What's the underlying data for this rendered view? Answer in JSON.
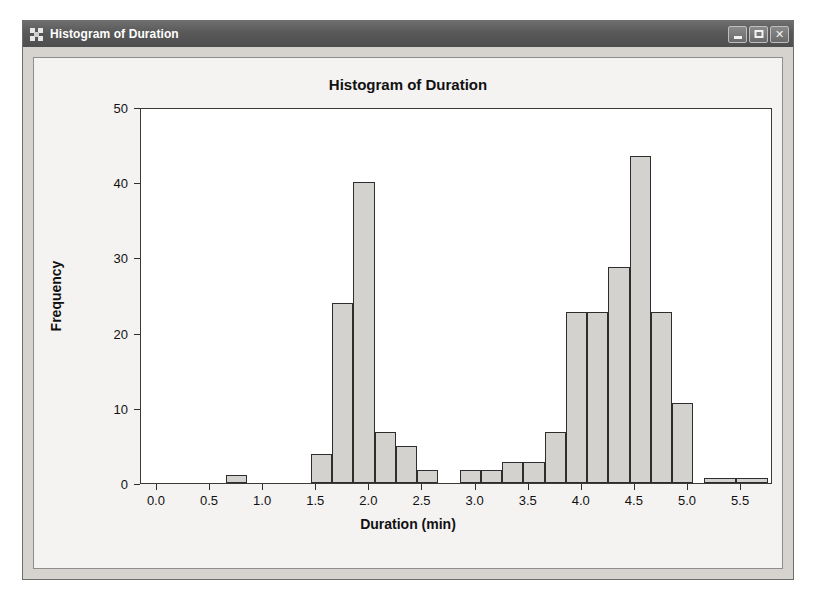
{
  "window": {
    "title": "Histogram of Duration",
    "icon": "app-grid-icon",
    "buttons": [
      {
        "name": "minimize",
        "label": "–"
      },
      {
        "name": "maximize",
        "label": "□"
      },
      {
        "name": "close",
        "label": "✕"
      }
    ]
  },
  "colors": {
    "titlebar": "#585858",
    "window_face": "#d6d3ce",
    "client_face": "#f4f3f1",
    "plot_face": "#ffffff",
    "bar_fill": "#d4d2cf",
    "bar_stroke": "#2e2e2e",
    "text": "#111111"
  },
  "chart_data": {
    "type": "bar",
    "title": "Histogram of Duration",
    "xlabel": "Duration (min)",
    "ylabel": "Frequency",
    "xlim": [
      -0.15,
      5.8
    ],
    "ylim": [
      0,
      50
    ],
    "xticks": [
      "0.0",
      "0.5",
      "1.0",
      "1.5",
      "2.0",
      "2.5",
      "3.0",
      "3.5",
      "4.0",
      "4.5",
      "5.0",
      "5.5"
    ],
    "xtick_values": [
      0.0,
      0.5,
      1.0,
      1.5,
      2.0,
      2.5,
      3.0,
      3.5,
      4.0,
      4.5,
      5.0,
      5.5
    ],
    "yticks": [
      "0",
      "10",
      "20",
      "30",
      "40",
      "50"
    ],
    "ytick_values": [
      0,
      10,
      20,
      30,
      40,
      50
    ],
    "grid": false,
    "legend": null,
    "bin_width": 0.2,
    "bins": [
      {
        "x0": 0.65,
        "x1": 0.85,
        "value": 1.0
      },
      {
        "x0": 1.45,
        "x1": 1.65,
        "value": 3.8
      },
      {
        "x0": 1.65,
        "x1": 1.85,
        "value": 24.0
      },
      {
        "x0": 1.85,
        "x1": 2.05,
        "value": 40.0
      },
      {
        "x0": 2.05,
        "x1": 2.25,
        "value": 6.8
      },
      {
        "x0": 2.25,
        "x1": 2.45,
        "value": 4.9
      },
      {
        "x0": 2.45,
        "x1": 2.65,
        "value": 1.7
      },
      {
        "x0": 2.85,
        "x1": 3.05,
        "value": 1.7
      },
      {
        "x0": 3.05,
        "x1": 3.25,
        "value": 1.7
      },
      {
        "x0": 3.25,
        "x1": 3.45,
        "value": 2.8
      },
      {
        "x0": 3.45,
        "x1": 3.65,
        "value": 2.8
      },
      {
        "x0": 3.65,
        "x1": 3.85,
        "value": 6.8
      },
      {
        "x0": 3.85,
        "x1": 4.05,
        "value": 22.7
      },
      {
        "x0": 4.05,
        "x1": 4.25,
        "value": 22.7
      },
      {
        "x0": 4.25,
        "x1": 4.45,
        "value": 28.7
      },
      {
        "x0": 4.45,
        "x1": 4.65,
        "value": 43.5
      },
      {
        "x0": 4.65,
        "x1": 4.85,
        "value": 22.7
      },
      {
        "x0": 4.85,
        "x1": 5.05,
        "value": 10.6
      },
      {
        "x0": 5.15,
        "x1": 5.45,
        "value": 0.7
      },
      {
        "x0": 5.45,
        "x1": 5.75,
        "value": 0.7
      }
    ]
  }
}
